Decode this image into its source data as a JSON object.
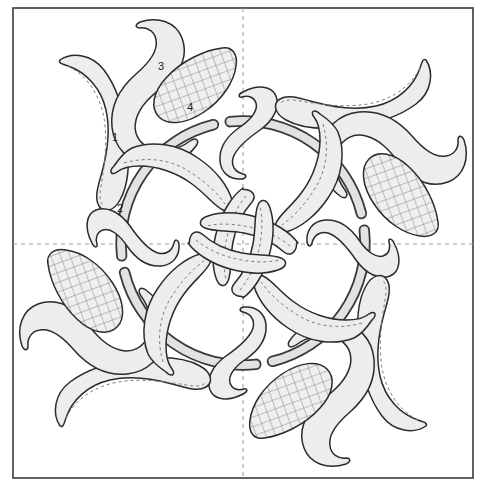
{
  "document": {
    "type": "appliqué quilt block pattern diagram",
    "title": "Floral Appliqué Block Pattern",
    "background_color": "#ffffff"
  },
  "frame": {
    "name": "block-border",
    "x": 13,
    "y": 8,
    "width": 460,
    "height": 470,
    "stroke_color": "#3a3a3a",
    "stroke_width": 1.6,
    "fill": "#ffffff"
  },
  "guides": {
    "stroke_color": "#9a9a9a",
    "dash": "4 4",
    "vertical_x": 243,
    "horizontal_y": 244,
    "lines": [
      {
        "name": "center-guide-vertical",
        "orientation": "vertical",
        "x1": 243,
        "y1": 8,
        "x2": 243,
        "y2": 478
      },
      {
        "name": "center-guide-horizontal",
        "orientation": "horizontal",
        "x1": 13,
        "y1": 244,
        "x2": 473,
        "y2": 244
      }
    ]
  },
  "colors": {
    "shape_fill": "#ededed",
    "shape_stroke": "#2b2b2b",
    "vine_fill": "#e2e2e2",
    "vine_stroke": "#3a3a3a",
    "hatch_fill": "#efefef",
    "hatch_line": "#8e8e8e",
    "stitch_line": "#7c7c7c",
    "label_color": "#1c1c1c",
    "guide_color": "#9a9a9a",
    "border_color": "#3a3a3a",
    "page_background": "#ffffff"
  },
  "symmetry": {
    "type": "4-fold rotational",
    "center_x": 243,
    "center_y": 243,
    "rotations_deg": [
      0,
      90,
      180,
      270
    ]
  },
  "vine": {
    "name": "circular-vine",
    "shape": "broken circular ring",
    "center_x": 243,
    "center_y": 243,
    "radius": 122,
    "band_width": 9,
    "fill": "#e2e2e2",
    "stroke": "#3a3a3a"
  },
  "labels": [
    {
      "id": "label-1",
      "text": "1",
      "x": 115,
      "y": 138,
      "describes": "long curved leaf with dashed stitch line"
    },
    {
      "id": "label-2",
      "text": "2",
      "x": 120,
      "y": 209,
      "describes": "vine stem band"
    },
    {
      "id": "label-3",
      "text": "3",
      "x": 161,
      "y": 67,
      "describes": "large curved flower petal"
    },
    {
      "id": "label-4",
      "text": "4",
      "x": 190,
      "y": 108,
      "describes": "cross-hatched teardrop center"
    }
  ],
  "motif": {
    "name": "repeating-floral-motif",
    "repeat_count": 4,
    "parts": [
      {
        "name": "flower-petal",
        "style": "solid-fill",
        "count_per_motif": 1
      },
      {
        "name": "hatched-teardrop",
        "style": "cross-hatched",
        "count_per_motif": 1
      },
      {
        "name": "long-leaf-outer",
        "style": "solid-fill-with-dashed-stitch",
        "count_per_motif": 1
      },
      {
        "name": "swirl-leaf-inner",
        "style": "solid-fill-with-dashed-stitch",
        "count_per_motif": 1
      },
      {
        "name": "pinwheel-leaf",
        "style": "solid-fill-with-dashed-stitch",
        "count_per_motif": 1
      },
      {
        "name": "side-leaf",
        "style": "solid-fill-with-dashed-stitch",
        "count_per_motif": 1
      }
    ]
  },
  "hatch": {
    "name": "cross-hatch-pattern",
    "spacing": 9,
    "angle_deg": -20,
    "line_color": "#8e8e8e",
    "line_width": 1.1
  }
}
